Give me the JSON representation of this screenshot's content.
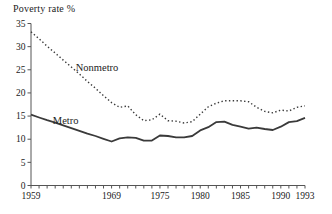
{
  "title": "Poverty rate %",
  "colors": {
    "axis": "#555555",
    "text": "#222222",
    "line": "#3a3a3a",
    "background": "#ffffff"
  },
  "chart_data": {
    "type": "line",
    "title": "Poverty rate %",
    "xlabel": "",
    "ylabel": "Poverty rate %",
    "xlim": [
      1959,
      1993
    ],
    "ylim": [
      0,
      35
    ],
    "grid": false,
    "legend_position": "inline-annotations",
    "y_ticks": [
      0,
      5,
      10,
      15,
      20,
      25,
      30,
      35
    ],
    "x_labeled_ticks": [
      1959,
      1969,
      1975,
      1980,
      1985,
      1990,
      1993
    ],
    "x_minor_tick_every_years": 1,
    "x": [
      1959,
      1960,
      1961,
      1962,
      1963,
      1964,
      1965,
      1966,
      1967,
      1968,
      1969,
      1970,
      1971,
      1972,
      1973,
      1974,
      1975,
      1976,
      1977,
      1978,
      1979,
      1980,
      1981,
      1982,
      1983,
      1984,
      1985,
      1986,
      1987,
      1988,
      1989,
      1990,
      1991,
      1992,
      1993
    ],
    "series": [
      {
        "name": "Nonmetro",
        "line_style": "dotted",
        "values": [
          33.2,
          31.7,
          30.1,
          28.6,
          27.1,
          25.6,
          24.1,
          22.5,
          21.0,
          19.4,
          17.9,
          16.9,
          17.2,
          15.3,
          14.0,
          14.2,
          15.4,
          14.0,
          13.9,
          13.5,
          13.8,
          15.4,
          17.0,
          17.8,
          18.3,
          18.3,
          18.3,
          18.1,
          16.9,
          16.0,
          15.7,
          16.3,
          16.1,
          16.9,
          17.2
        ]
      },
      {
        "name": "Metro",
        "line_style": "solid",
        "values": [
          15.3,
          14.7,
          14.1,
          13.6,
          13.0,
          12.4,
          11.8,
          11.2,
          10.7,
          10.1,
          9.5,
          10.2,
          10.4,
          10.3,
          9.7,
          9.7,
          10.8,
          10.7,
          10.4,
          10.4,
          10.7,
          11.9,
          12.6,
          13.7,
          13.8,
          13.1,
          12.7,
          12.3,
          12.5,
          12.2,
          12.0,
          12.7,
          13.7,
          13.9,
          14.6
        ]
      }
    ],
    "annotations": [
      {
        "text": "Nonmetro",
        "x": 1967.2,
        "y": 25.4
      },
      {
        "text": "Metro",
        "x": 1963.3,
        "y": 13.9
      }
    ]
  }
}
